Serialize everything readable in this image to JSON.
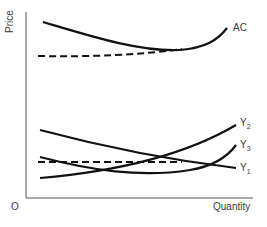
{
  "diagram": {
    "axes": {
      "y_label": "Price",
      "x_label": "Quantity",
      "origin_label": "O"
    },
    "curves": [
      {
        "id": "AC",
        "label": "AC",
        "style": "solid"
      },
      {
        "id": "AC-envelope",
        "label": "",
        "style": "dashed"
      },
      {
        "id": "Y2",
        "label": "Y",
        "subscript": "2",
        "style": "solid"
      },
      {
        "id": "Y3",
        "label": "Y",
        "subscript": "3",
        "style": "solid"
      },
      {
        "id": "Y1",
        "label": "Y",
        "subscript": "1",
        "style": "solid"
      },
      {
        "id": "Y-dashed",
        "label": "",
        "style": "dashed"
      }
    ],
    "colors": {
      "line": "#111111",
      "text": "#3a3a3a",
      "background": "#ffffff"
    }
  }
}
